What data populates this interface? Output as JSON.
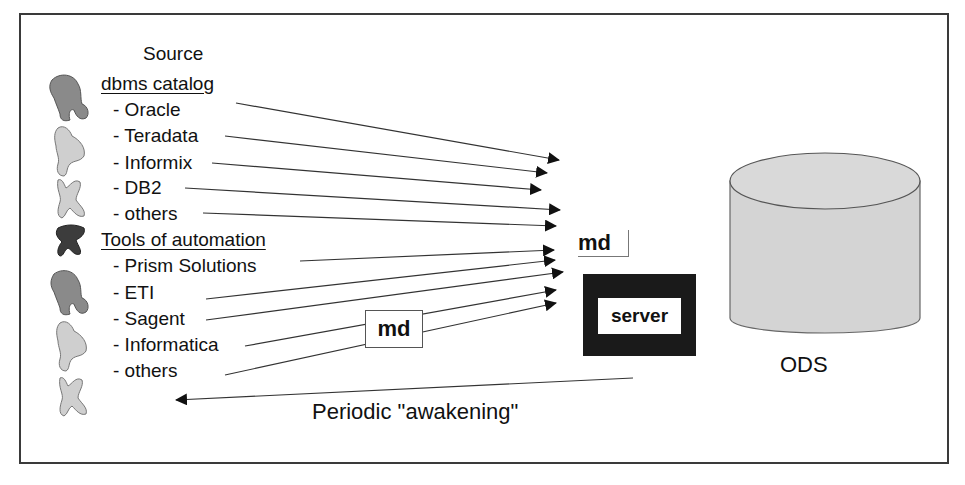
{
  "source": {
    "title": "Source",
    "dbms_catalog": {
      "heading": "dbms catalog",
      "items": [
        "- Oracle",
        "- Teradata",
        "- Informix",
        "- DB2",
        "- others"
      ]
    },
    "tools_of_automation": {
      "heading": "Tools of automation",
      "items": [
        "- Prism Solutions",
        "- ETI",
        "- Sagent",
        "- Informatica",
        "- others"
      ]
    }
  },
  "metadata": {
    "md_box_label": "md",
    "md_label": "md"
  },
  "server": {
    "label": "server"
  },
  "ods": {
    "label": "ODS"
  },
  "return_arrow": {
    "label": "Periodic \"awakening\""
  },
  "colors": {
    "frame": "#3a3a3a",
    "server_box": "#1a1a1a",
    "cylinder": "#d4d4d4",
    "icon_dark": "#3c3c3c",
    "icon_mid": "#8a8a8a",
    "icon_light": "#cfcfcf"
  }
}
